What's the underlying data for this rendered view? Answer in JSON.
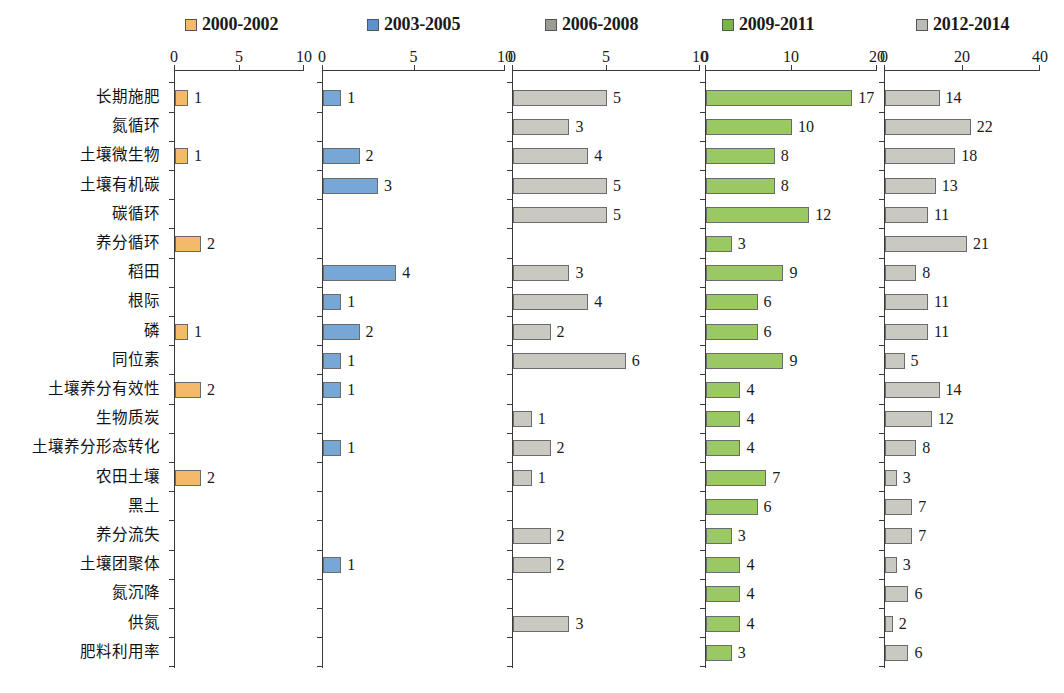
{
  "chart_data": {
    "type": "bar",
    "title": "",
    "xlabel": "",
    "ylabel": "",
    "orientation": "horizontal",
    "grid": false,
    "legend_position": "top",
    "categories": [
      "长期施肥",
      "氮循环",
      "土壤微生物",
      "土壤有机碳",
      "碳循环",
      "养分循环",
      "稻田",
      "根际",
      "磷",
      "同位素",
      "土壤养分有效性",
      "生物质炭",
      "土壤养分形态转化",
      "农田土壤",
      "黑土",
      "养分流失",
      "土壤团聚体",
      "氮沉降",
      "供氮",
      "肥料利用率"
    ],
    "panels": [
      {
        "name": "2000-2002",
        "color": "#f5b96a",
        "xlim": [
          0,
          10
        ],
        "xticks": [
          0,
          5,
          10
        ],
        "xticklabels": [
          "0",
          "5",
          "10"
        ],
        "values": [
          1,
          0,
          1,
          0,
          0,
          2,
          0,
          0,
          1,
          0,
          2,
          0,
          0,
          2,
          0,
          0,
          0,
          0,
          0,
          0
        ],
        "labels": [
          "1",
          "",
          "1",
          "",
          "",
          "2",
          "",
          "",
          "1",
          "",
          "2",
          "",
          "",
          "2",
          "",
          "",
          "",
          "",
          "",
          ""
        ]
      },
      {
        "name": "2003-2005",
        "color": "#77a7d4",
        "xlim": [
          0,
          10
        ],
        "xticks": [
          0,
          5,
          10
        ],
        "xticklabels": [
          "0",
          "5",
          "10"
        ],
        "values": [
          1,
          0,
          2,
          3,
          0,
          0,
          4,
          1,
          2,
          1,
          1,
          0,
          1,
          0,
          0,
          0,
          1,
          0,
          0,
          0
        ],
        "labels": [
          "1",
          "",
          "2",
          "3",
          "",
          "",
          "4",
          "1",
          "2",
          "1",
          "1",
          "",
          "1",
          "",
          "",
          "",
          "1",
          "",
          "",
          ""
        ]
      },
      {
        "name": "2006-2008",
        "color": "#c9c9c1",
        "xlim": [
          0,
          10
        ],
        "xticks": [
          0,
          5,
          10
        ],
        "xticklabels": [
          "0",
          "5",
          "10"
        ],
        "values": [
          5,
          3,
          4,
          5,
          5,
          0,
          3,
          4,
          2,
          6,
          0,
          1,
          2,
          1,
          0,
          2,
          2,
          0,
          3,
          0
        ],
        "labels": [
          "5",
          "3",
          "4",
          "5",
          "5",
          "",
          "3",
          "4",
          "2",
          "6",
          "",
          "1",
          "2",
          "1",
          "",
          "2",
          "2",
          "",
          "3",
          ""
        ]
      },
      {
        "name": "2009-2011",
        "color": "#9ac863",
        "xlim": [
          0,
          20
        ],
        "xticks": [
          0,
          10,
          20
        ],
        "xticklabels": [
          "0",
          "10",
          "20"
        ],
        "values": [
          17,
          10,
          8,
          8,
          12,
          3,
          9,
          6,
          6,
          9,
          4,
          4,
          4,
          7,
          6,
          3,
          4,
          4,
          4,
          3
        ],
        "labels": [
          "17",
          "10",
          "8",
          "8",
          "12",
          "3",
          "9",
          "6",
          "6",
          "9",
          "4",
          "4",
          "4",
          "7",
          "6",
          "3",
          "4",
          "4",
          "4",
          "3"
        ]
      },
      {
        "name": "2012-2014",
        "color": "#c9c9c1",
        "xlim": [
          0,
          40
        ],
        "xticks": [
          0,
          20,
          40
        ],
        "xticklabels": [
          "0",
          "20",
          "40"
        ],
        "values": [
          14,
          22,
          18,
          13,
          11,
          21,
          8,
          11,
          11,
          5,
          14,
          12,
          8,
          3,
          7,
          7,
          3,
          6,
          2,
          6
        ],
        "labels": [
          "14",
          "22",
          "18",
          "13",
          "11",
          "21",
          "8",
          "11",
          "11",
          "5",
          "14",
          "12",
          "8",
          "3",
          "7",
          "7",
          "3",
          "6",
          "2",
          "6"
        ]
      }
    ]
  },
  "legend": {
    "items": [
      {
        "label": "2000-2002",
        "color": "#f5b96a",
        "left": 185
      },
      {
        "label": "2003-2005",
        "color": "#5b92c8",
        "left": 367
      },
      {
        "label": "2006-2008",
        "color": "#9b9b93",
        "left": 545
      },
      {
        "label": "2009-2011",
        "color": "#7ab547",
        "left": 722
      },
      {
        "label": "2012-2014",
        "color": "#bcbcb6",
        "left": 916
      }
    ]
  },
  "layout": {
    "panel_geometry": [
      {
        "left": 174,
        "width": 130
      },
      {
        "left": 322,
        "width": 183
      },
      {
        "left": 512,
        "width": 188
      },
      {
        "left": 705,
        "width": 172
      },
      {
        "left": 884,
        "width": 156
      }
    ],
    "row_count": 20,
    "row_start_y": 27,
    "row_step": 29.2,
    "plot_height": 598
  }
}
